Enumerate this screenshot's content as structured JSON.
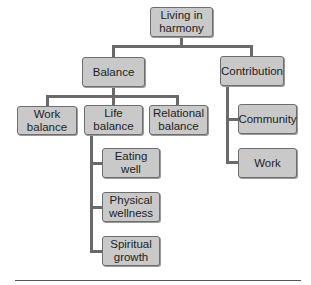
{
  "diagram": {
    "type": "hierarchy",
    "root": {
      "label": "Living in\nharmony"
    },
    "level1": [
      {
        "id": "balance",
        "label": "Balance"
      },
      {
        "id": "contribution",
        "label": "Contribution"
      }
    ],
    "balance_children": [
      {
        "id": "work-balance",
        "label": "Work\nbalance"
      },
      {
        "id": "life-balance",
        "label": "Life\nbalance"
      },
      {
        "id": "relational-balance",
        "label": "Relational\nbalance"
      }
    ],
    "life_balance_children": [
      {
        "id": "eating-well",
        "label": "Eating\nwell"
      },
      {
        "id": "physical-wellness",
        "label": "Physical\nwellness"
      },
      {
        "id": "spiritual-growth",
        "label": "Spiritual\ngrowth"
      }
    ],
    "contribution_children": [
      {
        "id": "community",
        "label": "Community"
      },
      {
        "id": "work",
        "label": "Work"
      }
    ],
    "colors": {
      "node_fill": "#c9c9c9",
      "node_border": "#6e6e6e",
      "connector": "#6a6a6a"
    }
  }
}
